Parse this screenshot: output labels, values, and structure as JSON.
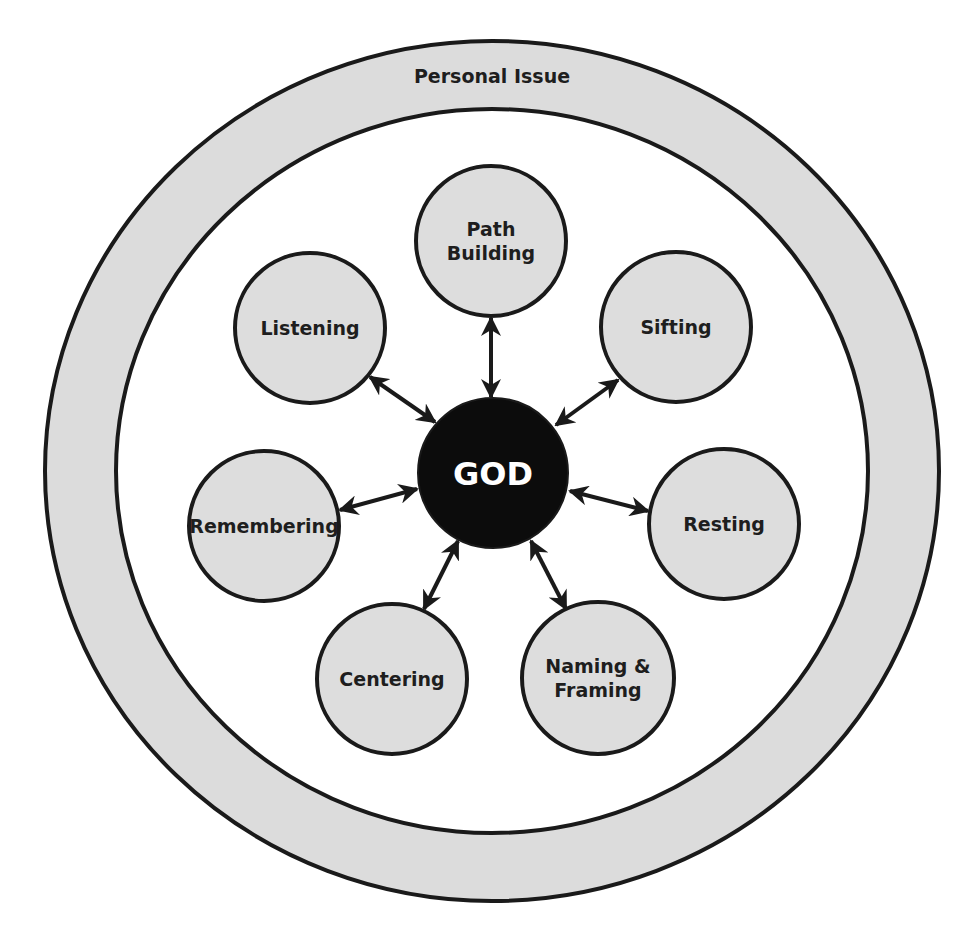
{
  "colors": {
    "ring_fill": "#dcdcdc",
    "node_fill": "#dddddd",
    "stroke": "#1a1a1a",
    "center_fill": "#0c0c0c",
    "center_text": "#ffffff",
    "background": "#ffffff"
  },
  "outer_ring": {
    "label": "Personal Issue",
    "cx": 492,
    "cy": 471,
    "outer_rx": 447,
    "outer_ry": 430,
    "inner_rx": 376,
    "inner_ry": 362
  },
  "center": {
    "label": "GOD",
    "cx": 493,
    "cy": 473,
    "r": 75
  },
  "nodes": [
    {
      "id": "path-building",
      "lines": [
        "Path",
        "Building"
      ],
      "cx": 491,
      "cy": 241,
      "r": 75,
      "arrow": {
        "x1": 491,
        "y1": 318,
        "x2": 491,
        "y2": 397
      }
    },
    {
      "id": "listening",
      "lines": [
        "Listening"
      ],
      "cx": 310,
      "cy": 328,
      "r": 75,
      "arrow": {
        "x1": 370,
        "y1": 377,
        "x2": 435,
        "y2": 422
      }
    },
    {
      "id": "sifting",
      "lines": [
        "Sifting"
      ],
      "cx": 676,
      "cy": 327,
      "r": 75,
      "arrow": {
        "x1": 618,
        "y1": 380,
        "x2": 556,
        "y2": 425
      }
    },
    {
      "id": "remembering",
      "lines": [
        "Remembering"
      ],
      "cx": 264,
      "cy": 526,
      "r": 75,
      "arrow": {
        "x1": 340,
        "y1": 510,
        "x2": 417,
        "y2": 489
      }
    },
    {
      "id": "resting",
      "lines": [
        "Resting"
      ],
      "cx": 724,
      "cy": 524,
      "r": 75,
      "arrow": {
        "x1": 570,
        "y1": 491,
        "x2": 648,
        "y2": 511
      }
    },
    {
      "id": "centering",
      "lines": [
        "Centering"
      ],
      "cx": 392,
      "cy": 679,
      "r": 75,
      "arrow": {
        "x1": 458,
        "y1": 541,
        "x2": 424,
        "y2": 609
      }
    },
    {
      "id": "naming-framing",
      "lines": [
        "Naming &",
        "Framing"
      ],
      "cx": 598,
      "cy": 678,
      "r": 76,
      "arrow": {
        "x1": 531,
        "y1": 541,
        "x2": 566,
        "y2": 609
      }
    }
  ]
}
